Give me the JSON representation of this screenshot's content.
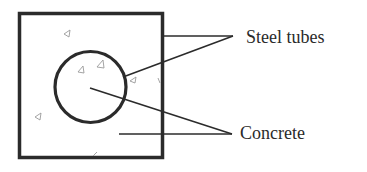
{
  "diagram": {
    "type": "cross-section",
    "labels": {
      "steel_tubes": "Steel tubes",
      "concrete": "Concrete"
    },
    "colors": {
      "stroke": "#2b2b2b",
      "aggregate": "#9a9a9a",
      "text": "#2a2a2a",
      "background": "#ffffff"
    },
    "components": [
      {
        "name": "outer-square-steel-tube",
        "shape": "square"
      },
      {
        "name": "inner-circular-steel-tube",
        "shape": "circle"
      },
      {
        "name": "concrete-infill",
        "shape": "fill with aggregate triangles"
      }
    ]
  }
}
